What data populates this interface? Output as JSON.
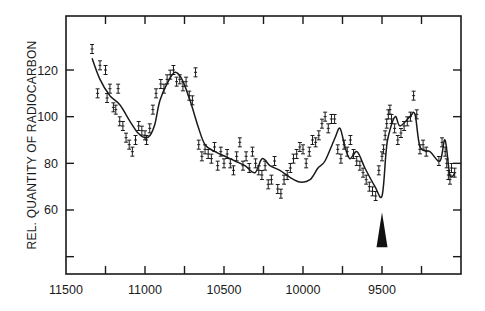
{
  "chart_data": {
    "type": "line",
    "title": "",
    "xlabel": "",
    "ylabel": "REL. QUANTITY OF RADIOCARBON",
    "xlim": [
      11500,
      9000
    ],
    "ylim": [
      35,
      135
    ],
    "x_reversed": true,
    "grid": false,
    "legend": null,
    "x_ticks": [
      11500,
      11250,
      11000,
      10750,
      10500,
      10250,
      10000,
      9750,
      9500,
      9250
    ],
    "x_tick_labels": [
      "11500",
      "11000",
      "10500",
      "10000",
      "9500"
    ],
    "x_tick_label_values": [
      11500,
      11000,
      10500,
      10000,
      9500
    ],
    "y_ticks": [
      40,
      60,
      80,
      100,
      120
    ],
    "y_tick_labels": [
      "60",
      "80",
      "100",
      "120"
    ],
    "y_tick_label_values": [
      60,
      80,
      100,
      120
    ],
    "series": [
      {
        "name": "smoothed curve",
        "style": "line",
        "x": [
          11335,
          11285,
          11222,
          11158,
          11095,
          11044,
          11000,
          10968,
          10937,
          10905,
          10854,
          10810,
          10766,
          10715,
          10665,
          10620,
          10557,
          10494,
          10430,
          10367,
          10304,
          10259,
          10209,
          10146,
          10082,
          10019,
          9956,
          9905,
          9861,
          9797,
          9766,
          9734,
          9703,
          9658,
          9608,
          9544,
          9500,
          9475,
          9462,
          9418,
          9386,
          9323,
          9291,
          9259,
          9196,
          9133,
          9101,
          9070,
          9038
        ],
        "values": [
          125,
          116,
          109,
          105,
          98,
          93,
          91,
          92,
          97,
          107,
          115,
          119,
          116,
          107,
          96,
          88,
          85,
          83,
          81,
          79,
          76,
          82,
          79,
          77,
          74,
          72,
          73,
          78,
          81,
          91,
          95,
          87,
          82,
          85,
          78,
          70,
          66,
          84,
          91,
          100,
          96,
          100,
          101,
          87,
          85,
          81,
          90,
          75,
          76
        ]
      },
      {
        "name": "measurements (with error bars)",
        "style": "scatter-errorbar",
        "x": [
          11335,
          11300,
          11285,
          11250,
          11240,
          11222,
          11200,
          11185,
          11170,
          11160,
          11140,
          11120,
          11100,
          11080,
          11060,
          11040,
          11020,
          11000,
          10990,
          10970,
          10950,
          10930,
          10900,
          10880,
          10860,
          10840,
          10820,
          10800,
          10780,
          10760,
          10740,
          10720,
          10700,
          10680,
          10660,
          10640,
          10620,
          10600,
          10580,
          10560,
          10540,
          10520,
          10500,
          10480,
          10460,
          10440,
          10420,
          10400,
          10380,
          10360,
          10340,
          10320,
          10300,
          10280,
          10260,
          10240,
          10220,
          10200,
          10180,
          10160,
          10140,
          10120,
          10100,
          10080,
          10060,
          10040,
          10020,
          10000,
          9980,
          9960,
          9940,
          9920,
          9900,
          9880,
          9860,
          9840,
          9820,
          9800,
          9780,
          9760,
          9740,
          9720,
          9700,
          9680,
          9660,
          9640,
          9620,
          9600,
          9580,
          9560,
          9540,
          9520,
          9500,
          9490,
          9480,
          9470,
          9460,
          9450,
          9440,
          9420,
          9400,
          9380,
          9360,
          9340,
          9320,
          9300,
          9280,
          9260,
          9240,
          9220,
          9140,
          9120,
          9100,
          9090,
          9080,
          9070,
          9060,
          9040
        ],
        "values": [
          129,
          110,
          122,
          120,
          108,
          112,
          104,
          103,
          112,
          98,
          96,
          91,
          88,
          85,
          90,
          96,
          94,
          92,
          90,
          95,
          103,
          110,
          114,
          112,
          116,
          118,
          120,
          115,
          116,
          113,
          115,
          109,
          107,
          119,
          88,
          83,
          86,
          84,
          82,
          87,
          79,
          85,
          80,
          84,
          80,
          77,
          83,
          89,
          79,
          83,
          78,
          85,
          80,
          77,
          75,
          79,
          71,
          73,
          81,
          69,
          67,
          73,
          75,
          78,
          82,
          84,
          87,
          86,
          80,
          85,
          90,
          89,
          92,
          97,
          100,
          95,
          99,
          99,
          86,
          82,
          88,
          85,
          90,
          84,
          81,
          79,
          76,
          73,
          70,
          68,
          66,
          77,
          83,
          86,
          92,
          97,
          101,
          103,
          99,
          95,
          90,
          93,
          96,
          98,
          100,
          109,
          101,
          86,
          88,
          85,
          81,
          89,
          85,
          80,
          75,
          73,
          78,
          76
        ]
      }
    ],
    "annotations": [
      {
        "type": "arrow",
        "direction": "up",
        "x": 9500,
        "y_tip": 59,
        "y_base": 44,
        "label": ""
      }
    ]
  }
}
